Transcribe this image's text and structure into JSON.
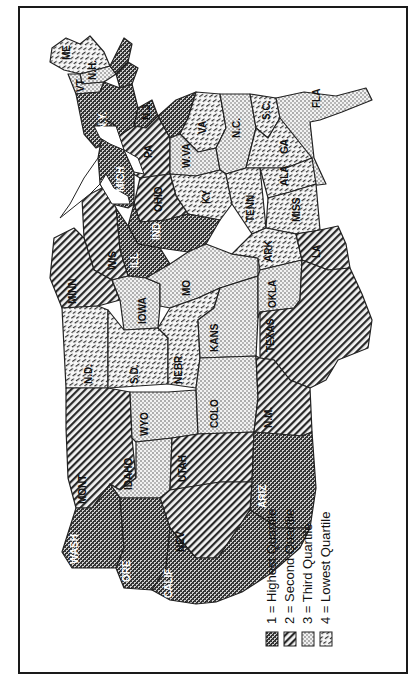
{
  "map": {
    "title": "",
    "orientation": "rotated 90 degrees counterclockwise (north at left)",
    "legend": {
      "items": [
        {
          "quartile": 1,
          "label": "1 = Highest Quartile",
          "pattern": "crosshatch-dark"
        },
        {
          "quartile": 2,
          "label": "2 = Second Quartile",
          "pattern": "diagonal-lines"
        },
        {
          "quartile": 3,
          "label": "3 = Third Quartile",
          "pattern": "dots"
        },
        {
          "quartile": 4,
          "label": "4 = Lowest Quartile",
          "pattern": "dashed-diagonal"
        }
      ]
    },
    "states": [
      {
        "abbr": "ME",
        "quartile": 4
      },
      {
        "abbr": "N.H.",
        "quartile": 3
      },
      {
        "abbr": "VT",
        "quartile": 3
      },
      {
        "abbr": "MASS",
        "quartile": 1
      },
      {
        "abbr": "R.I.",
        "quartile": 1
      },
      {
        "abbr": "CONN",
        "quartile": 1
      },
      {
        "abbr": "N.Y.",
        "quartile": 1
      },
      {
        "abbr": "N.J.",
        "quartile": 1
      },
      {
        "abbr": "PA",
        "quartile": 2
      },
      {
        "abbr": "DEL",
        "quartile": 1
      },
      {
        "abbr": "MD",
        "quartile": 1
      },
      {
        "abbr": "VA",
        "quartile": 4
      },
      {
        "abbr": "W.VA",
        "quartile": 3
      },
      {
        "abbr": "N.C.",
        "quartile": 3
      },
      {
        "abbr": "S.C.",
        "quartile": 4
      },
      {
        "abbr": "GA",
        "quartile": 4
      },
      {
        "abbr": "FLA",
        "quartile": 3
      },
      {
        "abbr": "OHIO",
        "quartile": 2
      },
      {
        "abbr": "KY",
        "quartile": 4
      },
      {
        "abbr": "TENN",
        "quartile": 4
      },
      {
        "abbr": "ALA",
        "quartile": 4
      },
      {
        "abbr": "MISS",
        "quartile": 4
      },
      {
        "abbr": "MICH",
        "quartile": 1
      },
      {
        "abbr": "IND",
        "quartile": 1
      },
      {
        "abbr": "ILL",
        "quartile": 1
      },
      {
        "abbr": "WIS",
        "quartile": 2
      },
      {
        "abbr": "MINN",
        "quartile": 2
      },
      {
        "abbr": "IOWA",
        "quartile": 3
      },
      {
        "abbr": "MO",
        "quartile": 3
      },
      {
        "abbr": "ARK",
        "quartile": 4
      },
      {
        "abbr": "LA",
        "quartile": 2
      },
      {
        "abbr": "N.D.",
        "quartile": 4
      },
      {
        "abbr": "S.D.",
        "quartile": 4
      },
      {
        "abbr": "NEBR",
        "quartile": 4
      },
      {
        "abbr": "KANS",
        "quartile": 3
      },
      {
        "abbr": "OKLA",
        "quartile": 3
      },
      {
        "abbr": "TEXAS",
        "quartile": 2
      },
      {
        "abbr": "MONT",
        "quartile": 2
      },
      {
        "abbr": "WYO",
        "quartile": 3
      },
      {
        "abbr": "COLO",
        "quartile": 3
      },
      {
        "abbr": "N.M.",
        "quartile": 2
      },
      {
        "abbr": "IDAHO",
        "quartile": 3
      },
      {
        "abbr": "UTAH",
        "quartile": 2
      },
      {
        "abbr": "ARIZ",
        "quartile": 1
      },
      {
        "abbr": "NEV",
        "quartile": 2
      },
      {
        "abbr": "WASH",
        "quartile": 1
      },
      {
        "abbr": "ORE",
        "quartile": 1
      },
      {
        "abbr": "CALIF",
        "quartile": 1
      }
    ]
  },
  "labels": {
    "ME": "ME",
    "NH": "N.H.",
    "VT": "VT",
    "MASS": "MASS",
    "RI": "R.I.",
    "CONN": "CONN",
    "NY": "N.Y.",
    "NJ": "N.J.",
    "PA": "PA",
    "DEL": "DEL",
    "MD": "MD",
    "VA": "VA",
    "WVA": "W.VA",
    "NC": "N.C.",
    "SC": "S.C.",
    "GA": "GA",
    "FLA": "FLA",
    "OHIO": "OHIO",
    "KY": "KY",
    "TENN": "TENN",
    "ALA": "ALA",
    "MISS": "MISS",
    "MICH": "MICH",
    "IND": "IND",
    "ILL": "ILL",
    "WIS": "WIS",
    "MINN": "MINN",
    "IOWA": "IOWA",
    "MO": "MO",
    "ARK": "ARK",
    "LA": "LA",
    "ND": "N.D.",
    "SD": "S.D.",
    "NEBR": "NEBR",
    "KANS": "KANS",
    "OKLA": "OKLA",
    "TEXAS": "TEXAS",
    "MONT": "MONT",
    "WYO": "WYO",
    "COLO": "COLO",
    "NM": "N.M.",
    "IDAHO": "IDAHO",
    "UTAH": "UTAH",
    "ARIZ": "ARIZ",
    "NEV": "NEV",
    "WASH": "WASH",
    "ORE": "ORE",
    "CALIF": "CALIF"
  },
  "legend_labels": {
    "q1": "1 = Highest Quartile",
    "q2": "2 = Second Quartile",
    "q3": "3 = Third Quartile",
    "q4": "4 = Lowest Quartile"
  }
}
